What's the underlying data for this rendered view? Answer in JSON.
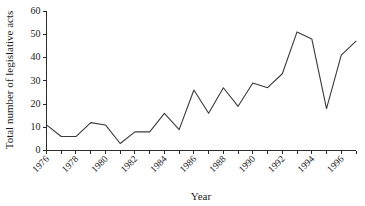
{
  "chart_data": {
    "type": "line",
    "title": "",
    "xlabel": "Year",
    "ylabel": "Total number of legislative acts",
    "xlim": [
      1976,
      1997
    ],
    "ylim": [
      0,
      60
    ],
    "grid": false,
    "legend": null,
    "x": [
      1976,
      1977,
      1978,
      1979,
      1980,
      1981,
      1982,
      1983,
      1984,
      1985,
      1986,
      1987,
      1988,
      1989,
      1990,
      1991,
      1992,
      1993,
      1994,
      1995,
      1996,
      1997
    ],
    "values": [
      11,
      6,
      6,
      12,
      11,
      3,
      8,
      8,
      16,
      9,
      26,
      16,
      27,
      19,
      29,
      27,
      33,
      51,
      48,
      18,
      41,
      47
    ],
    "series": [
      {
        "name": "Total number of legislative acts",
        "color": "#3a3a3a",
        "values": [
          11,
          6,
          6,
          12,
          11,
          3,
          8,
          8,
          16,
          9,
          26,
          16,
          27,
          19,
          29,
          27,
          33,
          51,
          48,
          18,
          41,
          47
        ]
      }
    ],
    "y_ticks": [
      0,
      10,
      20,
      30,
      40,
      50,
      60
    ],
    "y_tick_labels": [
      "0",
      "10",
      "20",
      "30",
      "40",
      "50",
      "60"
    ],
    "x_ticks": [
      1976,
      1977,
      1978,
      1979,
      1980,
      1981,
      1982,
      1983,
      1984,
      1985,
      1986,
      1987,
      1988,
      1989,
      1990,
      1991,
      1992,
      1993,
      1994,
      1995,
      1996,
      1997
    ],
    "x_tick_labels": [
      "1976",
      "",
      "1978",
      "",
      "1980",
      "",
      "1982",
      "",
      "1984",
      "",
      "1986",
      "",
      "1988",
      "",
      "1990",
      "",
      "1992",
      "",
      "1994",
      "",
      "1996",
      ""
    ]
  },
  "axes": {
    "x_title": "Year",
    "y_title": "Total number of legislative acts"
  }
}
